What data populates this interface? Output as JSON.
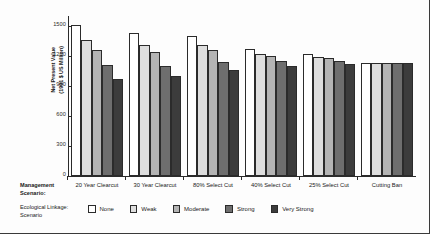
{
  "chart_data": {
    "type": "bar",
    "title": "",
    "xlabel": "Management Scenario:",
    "ylabel": "Net Present Value\n(1991 $ US Million)",
    "ylabel_line1": "Net Present Value",
    "ylabel_line2": "(1991 $ US Million)",
    "ylim": [
      0,
      1600
    ],
    "yticks": [
      0,
      300,
      600,
      900,
      1200,
      1500
    ],
    "ytick_labels": [
      "0",
      "300",
      "600",
      "900",
      "1200",
      "1500"
    ],
    "grid": false,
    "legend_position": "bottom",
    "legend_title": "Ecological Linkage Scenario",
    "categories": [
      "20 Year Clearcut",
      "30 Year Clearcut",
      "80% Select Cut",
      "40% Select Cut",
      "25% Select Cut",
      "Cutting Ban"
    ],
    "series": [
      {
        "name": "None",
        "color": "#ffffff",
        "values": [
          1510,
          1430,
          1405,
          1275,
          1220,
          1135
        ]
      },
      {
        "name": "Weak",
        "color": "#dedede",
        "values": [
          1360,
          1310,
          1310,
          1225,
          1190,
          1135
        ]
      },
      {
        "name": "Moderate",
        "color": "#b4b4b4",
        "values": [
          1260,
          1240,
          1260,
          1200,
          1185,
          1135
        ]
      },
      {
        "name": "Strong",
        "color": "#6e6e6e",
        "values": [
          1110,
          1100,
          1140,
          1150,
          1150,
          1135
        ]
      },
      {
        "name": "Very Strong",
        "color": "#3c3c3c",
        "values": [
          975,
          1005,
          1060,
          1100,
          1120,
          1135
        ]
      }
    ]
  },
  "labels": {
    "management_scenario_line1": "Management",
    "management_scenario_line2": "Scenario:",
    "ecological_linkage_line1": "Ecological Linkage:",
    "ecological_linkage_line2": "Scenario"
  }
}
